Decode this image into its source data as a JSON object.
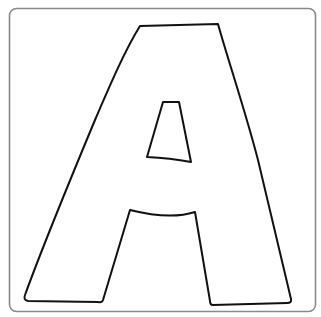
{
  "image": {
    "subject": "letter A coloring page outline",
    "letter": "A",
    "colors": {
      "background": "#ffffff",
      "frame_stroke": "#8a8a8a",
      "letter_stroke": "#111111",
      "letter_fill": "#ffffff"
    }
  }
}
